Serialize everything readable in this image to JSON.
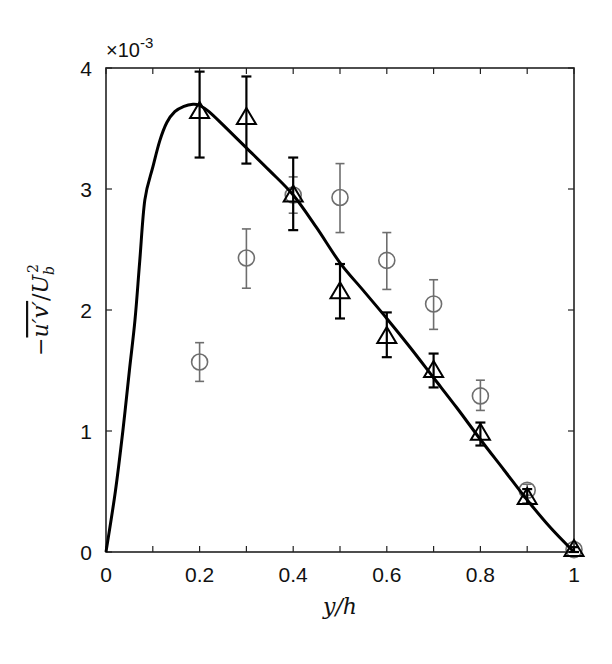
{
  "chart_data": {
    "type": "scatter",
    "title": "",
    "xlabel": "y/h",
    "ylabel": "-u'v' / U_b^2",
    "ylabel_parts": {
      "prefix": "−",
      "overline": "u′v′",
      "slash": "/",
      "base": "U",
      "sub": "b",
      "sup": "2"
    },
    "y_multiplier": "×10",
    "y_multiplier_exp": "-3",
    "xlim": [
      0,
      1
    ],
    "ylim": [
      0,
      4
    ],
    "x_ticks": [
      0,
      0.2,
      0.4,
      0.6,
      0.8,
      1
    ],
    "x_tick_labels": [
      "0",
      "0.2",
      "0.4",
      "0.6",
      "0.8",
      "1"
    ],
    "x_minor_ticks": [
      0.1,
      0.3,
      0.5,
      0.7,
      0.9
    ],
    "y_ticks": [
      0,
      1,
      2,
      3,
      4
    ],
    "y_tick_labels": [
      "0",
      "1",
      "2",
      "3",
      "4"
    ],
    "grid": false,
    "legend": null,
    "series": [
      {
        "name": "model curve",
        "kind": "line",
        "color": "#000000",
        "x": [
          0,
          0.02,
          0.036,
          0.05,
          0.062,
          0.072,
          0.083,
          0.1,
          0.115,
          0.13,
          0.147,
          0.165,
          0.186,
          0.2,
          0.22,
          0.25,
          0.3,
          0.35,
          0.4,
          0.45,
          0.5,
          0.55,
          0.6,
          0.65,
          0.7,
          0.75,
          0.8,
          0.85,
          0.9,
          0.95,
          1.0
        ],
        "y": [
          0,
          0.5,
          1.0,
          1.5,
          1.92,
          2.4,
          2.91,
          3.18,
          3.4,
          3.55,
          3.64,
          3.68,
          3.7,
          3.69,
          3.64,
          3.53,
          3.34,
          3.15,
          2.95,
          2.68,
          2.39,
          2.16,
          1.93,
          1.69,
          1.44,
          1.19,
          0.93,
          0.68,
          0.43,
          0.2,
          0.0
        ]
      },
      {
        "name": "triangles",
        "kind": "marker-triangle",
        "color": "#000000",
        "x": [
          0.2,
          0.3,
          0.4,
          0.5,
          0.6,
          0.7,
          0.8,
          0.9,
          1.0
        ],
        "y": [
          3.64,
          3.59,
          2.95,
          2.15,
          1.78,
          1.5,
          0.98,
          0.45,
          0.02
        ],
        "err_low": [
          3.26,
          3.21,
          2.66,
          1.93,
          1.61,
          1.36,
          0.88,
          0.4,
          0.0
        ],
        "err_high": [
          3.97,
          3.93,
          3.26,
          2.38,
          1.98,
          1.64,
          1.07,
          0.52,
          0.04
        ]
      },
      {
        "name": "circles",
        "kind": "marker-circle",
        "color": "#6e6e6e",
        "x": [
          0.2,
          0.3,
          0.4,
          0.5,
          0.6,
          0.7,
          0.8,
          0.9,
          1.0
        ],
        "y": [
          1.57,
          2.43,
          2.95,
          2.93,
          2.41,
          2.05,
          1.29,
          0.51,
          0.02
        ],
        "err_low": [
          1.41,
          2.18,
          2.8,
          2.64,
          2.17,
          1.84,
          1.17,
          0.47,
          0.0
        ],
        "err_high": [
          1.73,
          2.67,
          3.1,
          3.21,
          2.64,
          2.25,
          1.42,
          0.56,
          0.04
        ]
      }
    ]
  }
}
